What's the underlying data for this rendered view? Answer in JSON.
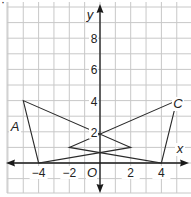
{
  "diagram": {
    "type": "coordinate-plane",
    "axes": {
      "x_label": "x",
      "y_label": "y",
      "origin_label": "O",
      "x_ticks": [
        "−4",
        "−2",
        "2",
        "4"
      ],
      "y_ticks": [
        "2",
        "4",
        "6",
        "8"
      ],
      "x_range": [
        -6,
        6
      ],
      "y_range": [
        -2,
        10
      ],
      "grid_step": 1,
      "label_step": 2
    },
    "figures": [
      {
        "name": "A",
        "vertices": [
          [
            -5,
            4
          ],
          [
            -4,
            0
          ],
          [
            2,
            1
          ]
        ]
      },
      {
        "name": "C",
        "vertices": [
          [
            5,
            4
          ],
          [
            4,
            0
          ],
          [
            -2,
            1
          ]
        ]
      }
    ],
    "marker": "·"
  }
}
